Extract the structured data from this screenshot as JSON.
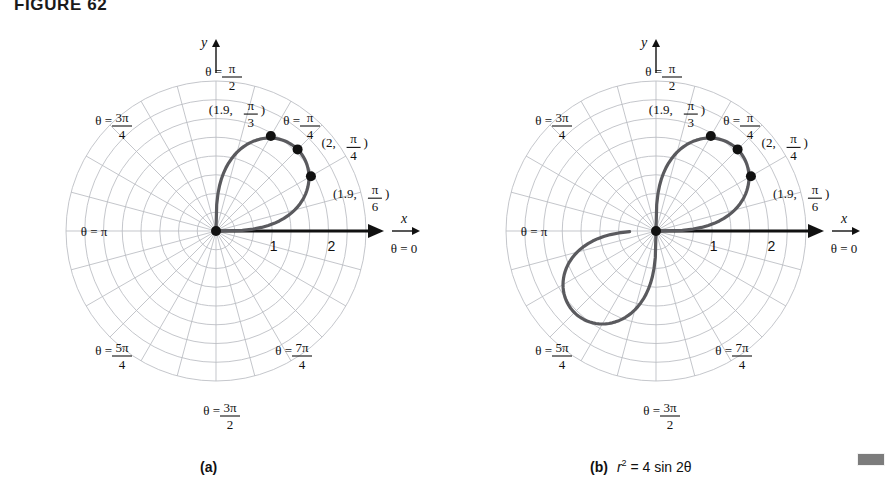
{
  "figure": {
    "title": "FIGURE 62",
    "corner_marker": "gray-block"
  },
  "panels": [
    {
      "id": "a",
      "caption": "(a)",
      "equation": "",
      "equation_plain": "",
      "axis_labels": {
        "x": "x",
        "y": "y"
      },
      "radial_ticks": [
        "1",
        "2"
      ],
      "angle_labels": [
        {
          "prefix": "θ =",
          "num": "π",
          "den": "2",
          "whole": ""
        },
        {
          "prefix": "θ =",
          "num": "3π",
          "den": "4",
          "whole": ""
        },
        {
          "prefix": "θ =",
          "num": "",
          "den": "",
          "whole": "π"
        },
        {
          "prefix": "θ =",
          "num": "5π",
          "den": "4",
          "whole": ""
        },
        {
          "prefix": "θ =",
          "num": "3π",
          "den": "2",
          "whole": ""
        },
        {
          "prefix": "θ =",
          "num": "7π",
          "den": "4",
          "whole": ""
        },
        {
          "prefix": "θ =",
          "num": "π",
          "den": "4",
          "whole": ""
        },
        {
          "prefix": "θ =",
          "num": "",
          "den": "",
          "whole": "0"
        }
      ],
      "points": [
        {
          "r": "1.9",
          "num": "π",
          "den": "3",
          "r_val": 1.9,
          "theta_deg": 60
        },
        {
          "r": "2",
          "num": "π",
          "den": "4",
          "r_val": 2.0,
          "theta_deg": 45
        },
        {
          "r": "1.9",
          "num": "π",
          "den": "6",
          "r_val": 1.9,
          "theta_deg": 30
        }
      ]
    },
    {
      "id": "b",
      "caption": "(b)",
      "equation": "r² = 4 sin 2θ",
      "equation_plain": "r^2 = 4 sin 2theta",
      "axis_labels": {
        "x": "x",
        "y": "y"
      },
      "radial_ticks": [
        "1",
        "2"
      ],
      "angle_labels": [
        {
          "prefix": "θ =",
          "num": "π",
          "den": "2",
          "whole": ""
        },
        {
          "prefix": "θ =",
          "num": "3π",
          "den": "4",
          "whole": ""
        },
        {
          "prefix": "θ =",
          "num": "",
          "den": "",
          "whole": "π"
        },
        {
          "prefix": "θ =",
          "num": "5π",
          "den": "4",
          "whole": ""
        },
        {
          "prefix": "θ =",
          "num": "3π",
          "den": "2",
          "whole": ""
        },
        {
          "prefix": "θ =",
          "num": "7π",
          "den": "4",
          "whole": ""
        },
        {
          "prefix": "θ =",
          "num": "π",
          "den": "4",
          "whole": ""
        },
        {
          "prefix": "θ =",
          "num": "",
          "den": "",
          "whole": "0"
        }
      ],
      "points": [
        {
          "r": "1.9",
          "num": "π",
          "den": "3",
          "r_val": 1.9,
          "theta_deg": 60
        },
        {
          "r": "2",
          "num": "π",
          "den": "4",
          "r_val": 2.0,
          "theta_deg": 45
        },
        {
          "r": "1.9",
          "num": "π",
          "den": "6",
          "r_val": 1.9,
          "theta_deg": 30
        }
      ]
    }
  ],
  "chart_data": {
    "type": "line",
    "title": "FIGURE 62",
    "polar": true,
    "xlabel": "x",
    "ylabel": "y",
    "rlim": [
      0,
      2.6
    ],
    "r_ticks": [
      1,
      2
    ],
    "theta_tick_labels": [
      "θ = 0",
      "θ = π/4",
      "θ = π/2",
      "θ = 3π/4",
      "θ = π",
      "θ = 5π/4",
      "θ = 3π/2",
      "θ = 7π/4"
    ],
    "grid": true,
    "grid_circles": 8,
    "grid_spokes": 24,
    "legend": "none",
    "series": [
      {
        "name": "(a) r = 2 sqrt(sin 2theta), first-quadrant loop",
        "panel": "a",
        "equation": "r^2 = 4 sin 2theta",
        "theta_range_deg": [
          0,
          90
        ],
        "annotations": [
          {
            "label": "(1.9, π/3)",
            "r": 1.9,
            "theta_deg": 60
          },
          {
            "label": "(2, π/4)",
            "r": 2.0,
            "theta_deg": 45
          },
          {
            "label": "(1.9, π/6)",
            "r": 1.9,
            "theta_deg": 30
          }
        ],
        "samples_r_theta": [
          [
            0.0,
            0
          ],
          [
            1.02,
            7.5
          ],
          [
            1.41,
            15
          ],
          [
            1.72,
            22.5
          ],
          [
            1.9,
            30
          ],
          [
            1.99,
            37.5
          ],
          [
            2.0,
            45
          ],
          [
            1.99,
            52.5
          ],
          [
            1.9,
            60
          ],
          [
            1.72,
            67.5
          ],
          [
            1.41,
            75
          ],
          [
            1.02,
            82.5
          ],
          [
            0.0,
            90
          ]
        ]
      },
      {
        "name": "(b) full lemniscate r^2 = 4 sin 2theta, both loops",
        "panel": "b",
        "equation": "r^2 = 4 sin 2theta",
        "theta_range_deg": [
          0,
          270
        ],
        "annotations": [
          {
            "label": "(1.9, π/3)",
            "r": 1.9,
            "theta_deg": 60
          },
          {
            "label": "(2, π/4)",
            "r": 2.0,
            "theta_deg": 45
          },
          {
            "label": "(1.9, π/6)",
            "r": 1.9,
            "theta_deg": 30
          }
        ],
        "samples_r_theta": [
          [
            0.0,
            0
          ],
          [
            1.02,
            7.5
          ],
          [
            1.41,
            15
          ],
          [
            1.72,
            22.5
          ],
          [
            1.9,
            30
          ],
          [
            1.99,
            37.5
          ],
          [
            2.0,
            45
          ],
          [
            1.99,
            52.5
          ],
          [
            1.9,
            60
          ],
          [
            1.72,
            67.5
          ],
          [
            1.41,
            75
          ],
          [
            1.02,
            82.5
          ],
          [
            0.0,
            90
          ],
          [
            0.0,
            180
          ],
          [
            1.02,
            187.5
          ],
          [
            1.41,
            195
          ],
          [
            1.72,
            202.5
          ],
          [
            1.9,
            210
          ],
          [
            1.99,
            217.5
          ],
          [
            2.0,
            225
          ],
          [
            1.99,
            232.5
          ],
          [
            1.9,
            240
          ],
          [
            1.72,
            247.5
          ],
          [
            1.41,
            255
          ],
          [
            1.02,
            262.5
          ],
          [
            0.0,
            270
          ]
        ]
      }
    ]
  }
}
